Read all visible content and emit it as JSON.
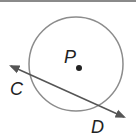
{
  "figure": {
    "circle": {
      "center_label": "P",
      "stroke": "#8c8c8c"
    },
    "secant": {
      "point_1": "C",
      "point_2": "D",
      "stroke": "#555555"
    },
    "labels": {
      "center": "P",
      "point_c": "C",
      "point_d": "D"
    }
  }
}
